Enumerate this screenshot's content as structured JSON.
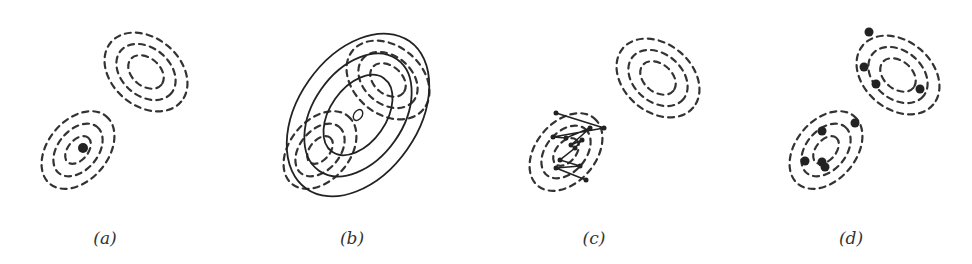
{
  "figure": {
    "panels": [
      {
        "id": "a",
        "label": "(a)",
        "label_x": 105,
        "description": "bimodal density contours with single mode point"
      },
      {
        "id": "b",
        "label": "(b)",
        "label_x": 352,
        "description": "Gaussian approximation ellipses over density contours"
      },
      {
        "id": "c",
        "label": "(c)",
        "label_x": 594,
        "description": "random-walk trajectory in lower mode"
      },
      {
        "id": "d",
        "label": "(d)",
        "label_x": 851,
        "description": "samples spread over both modes"
      }
    ],
    "colors": {
      "contour": "#333333",
      "ink": "#222222",
      "background": "#ffffff"
    },
    "contours": {
      "top_blob": {
        "rx": [
          20,
          33,
          46
        ],
        "ry": [
          14,
          24,
          34
        ],
        "rotate": 40
      },
      "bottom_blob": {
        "rx": [
          16,
          30,
          44
        ],
        "ry": [
          10,
          20,
          30
        ],
        "rotate": -50
      }
    },
    "panel_a": {
      "top_center": [
        146,
        72
      ],
      "bottom_center": [
        78,
        150
      ],
      "mode_point": [
        83,
        148
      ]
    },
    "panel_b": {
      "top_center": [
        388,
        80
      ],
      "bottom_center": [
        320,
        150
      ],
      "ellipse_center": [
        358,
        115
      ],
      "ellipse_rx": [
        45,
        68,
        90
      ],
      "ellipse_ry": [
        28,
        45,
        60
      ],
      "ellipse_rotate": -55
    },
    "panel_c": {
      "top_center": [
        658,
        78
      ],
      "bottom_center": [
        566,
        152
      ],
      "path": [
        [
          556,
          113
        ],
        [
          604,
          128
        ],
        [
          553,
          137
        ],
        [
          566,
          138
        ],
        [
          590,
          128
        ],
        [
          571,
          145
        ],
        [
          582,
          140
        ],
        [
          575,
          148
        ],
        [
          560,
          160
        ],
        [
          580,
          166
        ],
        [
          556,
          168
        ],
        [
          586,
          180
        ]
      ]
    },
    "panel_d": {
      "top_center": [
        898,
        75
      ],
      "bottom_center": [
        826,
        150
      ],
      "samples": [
        [
          869,
          32
        ],
        [
          864,
          67
        ],
        [
          876,
          84
        ],
        [
          920,
          89
        ],
        [
          855,
          123
        ],
        [
          822,
          131
        ],
        [
          805,
          161
        ],
        [
          822,
          162
        ],
        [
          825,
          167
        ]
      ]
    }
  }
}
